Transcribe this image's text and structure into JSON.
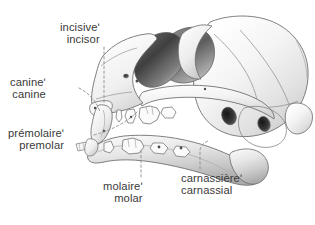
{
  "figure": {
    "background_color": "#ffffff",
    "line_color": "#5a5a5a",
    "text_color": "#3a3a3a",
    "leader_color": "#8c8c8c",
    "bone_light": "#fbfbfb",
    "bone_mid": "#dcdcdc",
    "bone_shadow": "#9a9a9a",
    "cavity_dark": "#3d3d3d"
  },
  "labels": {
    "incisor": {
      "fr": "incisiveʹ",
      "en": "incisor"
    },
    "canine": {
      "fr": "canineʹ",
      "en": "canine"
    },
    "premolar": {
      "fr": "prémolaireʹ",
      "en": "premolar"
    },
    "molar": {
      "fr": "molaireʹ",
      "en": "molar"
    },
    "carnassial": {
      "fr": "carnassièreʹ",
      "en": "carnassial"
    }
  }
}
